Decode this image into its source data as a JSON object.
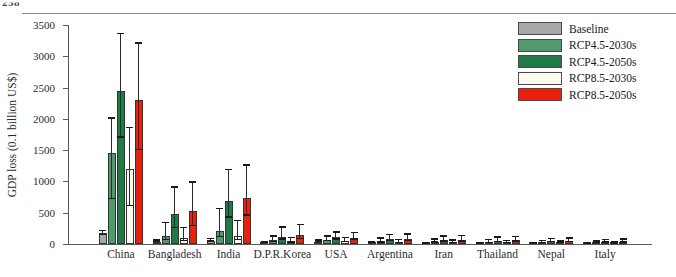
{
  "header": {
    "cropped_text": "238"
  },
  "chart_data": {
    "type": "bar",
    "title": "",
    "xlabel": "",
    "ylabel": "GDP loss (0.1 billion US$)",
    "ylim": [
      0,
      3500
    ],
    "ytick_step": 500,
    "yticks": [
      0,
      500,
      1000,
      1500,
      2000,
      2500,
      3000,
      3500
    ],
    "grid": false,
    "legend_position": "top-right",
    "error_bars": true,
    "categories": [
      "China",
      "Bangladesh",
      "India",
      "D.P.R.Korea",
      "USA",
      "Argentina",
      "Iran",
      "Thailand",
      "Nepal",
      "Italy"
    ],
    "series": [
      {
        "name": "Baseline",
        "color": "#a8a8a8",
        "values": [
          170,
          40,
          55,
          18,
          38,
          15,
          12,
          10,
          8,
          7
        ],
        "err_low": [
          140,
          30,
          40,
          12,
          28,
          10,
          8,
          6,
          5,
          4
        ],
        "err_high": [
          205,
          55,
          75,
          26,
          50,
          22,
          17,
          15,
          12,
          11
        ]
      },
      {
        "name": "RCP4.5-2030s",
        "color": "#4e9c6e",
        "values": [
          1460,
          130,
          215,
          60,
          70,
          45,
          35,
          30,
          25,
          20
        ],
        "err_low": [
          720,
          60,
          105,
          28,
          42,
          22,
          18,
          14,
          12,
          10
        ],
        "err_high": [
          2000,
          330,
          560,
          120,
          115,
          85,
          70,
          60,
          48,
          40
        ]
      },
      {
        "name": "RCP4.5-2050s",
        "color": "#1f7a45",
        "values": [
          2450,
          480,
          690,
          120,
          105,
          75,
          62,
          55,
          42,
          34
        ],
        "err_low": [
          1700,
          250,
          420,
          70,
          70,
          45,
          38,
          32,
          26,
          20
        ],
        "err_high": [
          3350,
          900,
          1180,
          260,
          180,
          140,
          118,
          100,
          80,
          64
        ]
      },
      {
        "name": "RCP8.5-2030s",
        "color": "#fdfbee",
        "values": [
          1200,
          100,
          135,
          42,
          52,
          32,
          26,
          22,
          18,
          14
        ],
        "err_low": [
          600,
          45,
          62,
          20,
          30,
          16,
          13,
          11,
          9,
          7
        ],
        "err_high": [
          1850,
          250,
          360,
          95,
          92,
          62,
          52,
          44,
          36,
          28
        ]
      },
      {
        "name": "RCP8.5-2050s",
        "color": "#e8200e",
        "values": [
          2300,
          520,
          740,
          140,
          100,
          80,
          68,
          60,
          45,
          36
        ],
        "err_low": [
          1500,
          280,
          450,
          80,
          66,
          48,
          40,
          35,
          27,
          22
        ],
        "err_high": [
          3200,
          980,
          1250,
          300,
          175,
          150,
          126,
          108,
          84,
          68
        ]
      }
    ]
  }
}
